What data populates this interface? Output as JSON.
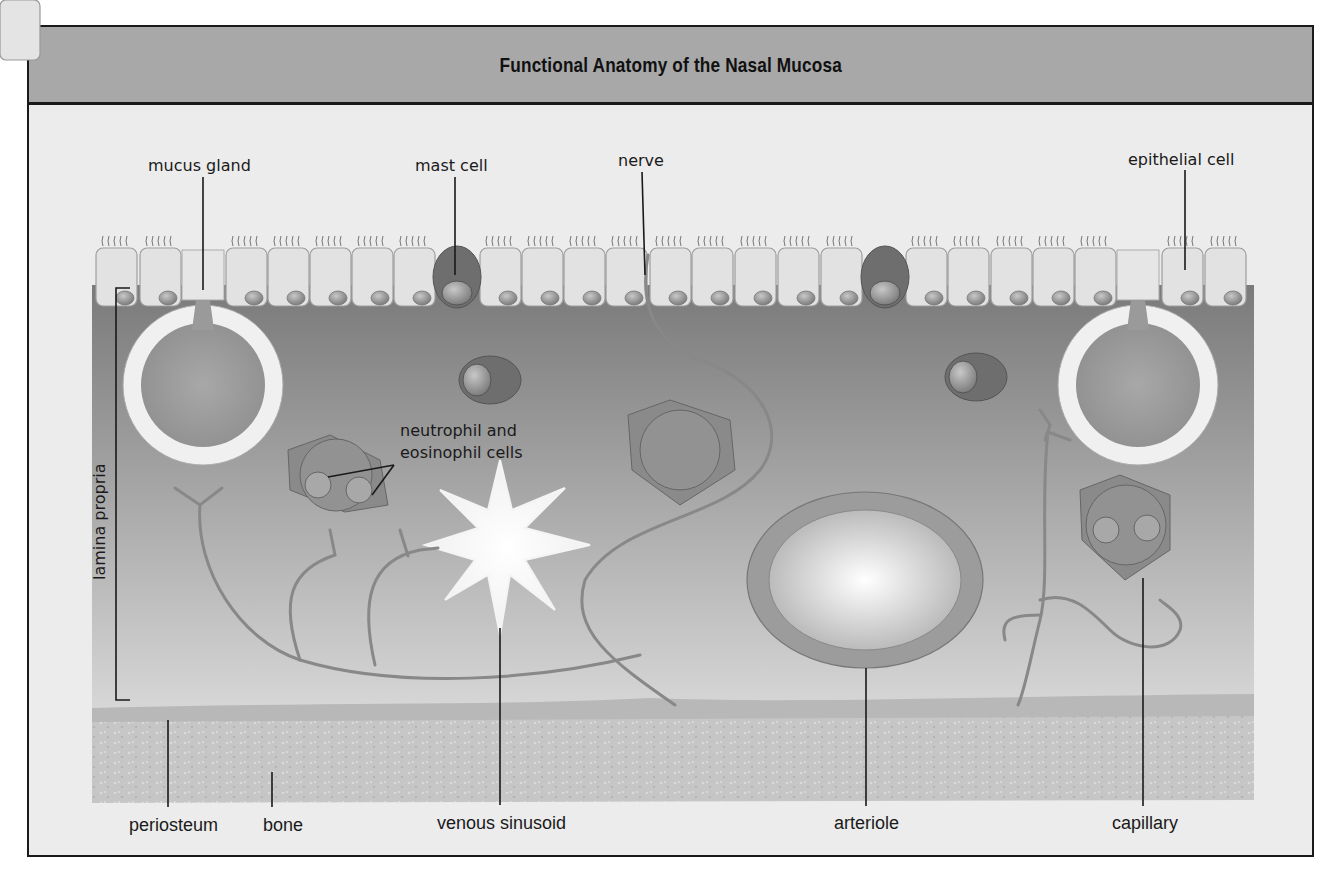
{
  "title": "Functional Anatomy of the Nasal Mucosa",
  "labels": {
    "mucus_gland": "mucus gland",
    "mast_cell": "mast cell",
    "nerve": "nerve",
    "epithelial_cell": "epithelial cell",
    "lamina_propria": "lamina propria",
    "neutrophil_eosinophil_line1": "neutrophil and",
    "neutrophil_eosinophil_line2": "eosinophil cells",
    "periosteum": "periosteum",
    "bone": "bone",
    "venous_sinusoid": "venous sinusoid",
    "arteriole": "arteriole",
    "capillary": "capillary"
  },
  "colors": {
    "frame_border": "#1a1a1a",
    "title_bar": "#a8a8a8",
    "background": "#ececec",
    "tissue_top": "#7d7d7d",
    "tissue_bottom": "#d6d6d6",
    "epithelium": "#e6e6e6",
    "bone": "#bdbdbd"
  }
}
